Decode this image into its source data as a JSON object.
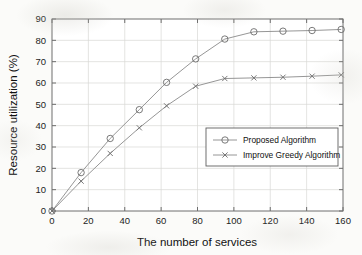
{
  "chart_data": {
    "type": "line",
    "title": "",
    "xlabel": "The number of services",
    "ylabel": "Resource utilization (%)",
    "xlim": [
      0,
      160
    ],
    "ylim": [
      0,
      90
    ],
    "xticks": [
      0,
      20,
      40,
      60,
      80,
      100,
      120,
      140,
      160
    ],
    "yticks": [
      0,
      10,
      20,
      30,
      40,
      50,
      60,
      70,
      80,
      90
    ],
    "grid": true,
    "legend_position": "center-right",
    "x": [
      0,
      16,
      32,
      48,
      63,
      79,
      95,
      111,
      127,
      143,
      159
    ],
    "series": [
      {
        "name": "Proposed Algorithm",
        "marker": "circle",
        "values": [
          0,
          18,
          34,
          47.5,
          60.3,
          71.3,
          80.6,
          84,
          84.3,
          84.6,
          85.1
        ]
      },
      {
        "name": "Improve Greedy Algorithm",
        "marker": "x",
        "values": [
          0,
          14,
          27,
          39,
          49.3,
          58.5,
          62.1,
          62.4,
          62.7,
          63.2,
          63.8
        ]
      }
    ],
    "colors": {
      "line": "#8a8a8a",
      "marker": "#6b6b6b",
      "axis": "#6e6e6e",
      "grid": "#d9d9d6",
      "text": "#111111",
      "background": "#fbfbf9"
    }
  },
  "axes": {
    "x_title": "The number of services",
    "y_title": "Resource utilization (%)",
    "x_tick_labels": [
      "0",
      "20",
      "40",
      "60",
      "80",
      "100",
      "120",
      "140",
      "160"
    ],
    "y_tick_labels": [
      "0",
      "10",
      "20",
      "30",
      "40",
      "50",
      "60",
      "70",
      "80",
      "90"
    ]
  },
  "legend": {
    "entries": [
      {
        "label": "Proposed Algorithm"
      },
      {
        "label": "Improve Greedy Algorithm"
      }
    ]
  }
}
